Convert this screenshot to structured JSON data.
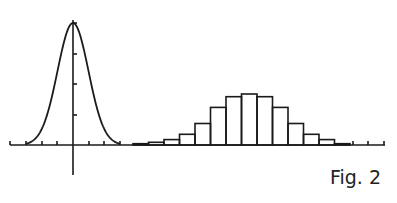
{
  "caption": "Fig. 2",
  "colors": {
    "ink": "#1a1a1a",
    "background": "#ffffff"
  },
  "chart_data": [
    {
      "type": "line",
      "title": "",
      "xlabel": "",
      "ylabel": "",
      "description": "Normal (Gaussian) probability density curve centered at 0",
      "x": [
        -4,
        -3,
        -2,
        -1,
        0,
        1,
        2,
        3,
        4
      ],
      "values": [
        0.0003,
        0.011,
        0.135,
        0.607,
        1.0,
        0.607,
        0.135,
        0.011,
        0.0003
      ],
      "xticks_count": 8,
      "yticks_count": 4,
      "grid": false,
      "legend": null
    },
    {
      "type": "bar",
      "title": "",
      "xlabel": "",
      "ylabel": "",
      "description": "Histogram approximating a bell-shaped (binomial/normal) distribution",
      "categories": [
        1,
        2,
        3,
        4,
        5,
        6,
        7,
        8,
        9,
        10,
        11,
        12,
        13,
        14
      ],
      "values": [
        0.5,
        1,
        2,
        4,
        8,
        14,
        18,
        19,
        18,
        14,
        8,
        4,
        2,
        0.5
      ],
      "ylim": [
        0,
        20
      ],
      "grid": false,
      "legend": null
    }
  ]
}
